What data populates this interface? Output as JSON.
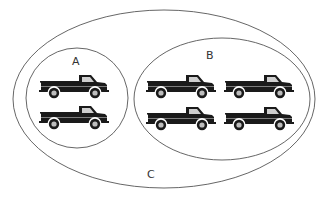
{
  "diagram": {
    "type": "venn-nested-sets",
    "sets": [
      {
        "id": "C",
        "label": "C",
        "role": "universal-set",
        "contains": [
          "A",
          "B"
        ],
        "truck_count": 6
      },
      {
        "id": "A",
        "label": "A",
        "role": "subset",
        "truck_count": 2
      },
      {
        "id": "B",
        "label": "B",
        "role": "subset",
        "truck_count": 4
      }
    ],
    "element_icon": "pickup-truck-icon",
    "colors": {
      "background": "#ffffff",
      "outline": "#555555",
      "truck_body": "#1a1a1a",
      "truck_window": "#cfcfcf",
      "wheel_hub": "#bdbdbd",
      "label": "#333333"
    }
  },
  "labels": {
    "a": "A",
    "b": "B",
    "c": "C"
  }
}
